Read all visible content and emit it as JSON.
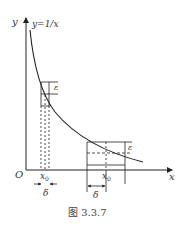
{
  "figure": {
    "function_label": "y=1/x",
    "y_axis_label": "y",
    "x_axis_label": "x",
    "origin_label": "O",
    "epsilon_label_left": "ε",
    "epsilon_label_right": "ε",
    "x0_label_left": "x",
    "x0_sub_left": "0",
    "x0_label_right": "x",
    "x0_sub_right": "0",
    "delta_label_left": "δ",
    "delta_label_right": "δ",
    "caption": "图 3.3.7"
  },
  "colors": {
    "stroke": "#222222",
    "background": "#ffffff"
  }
}
